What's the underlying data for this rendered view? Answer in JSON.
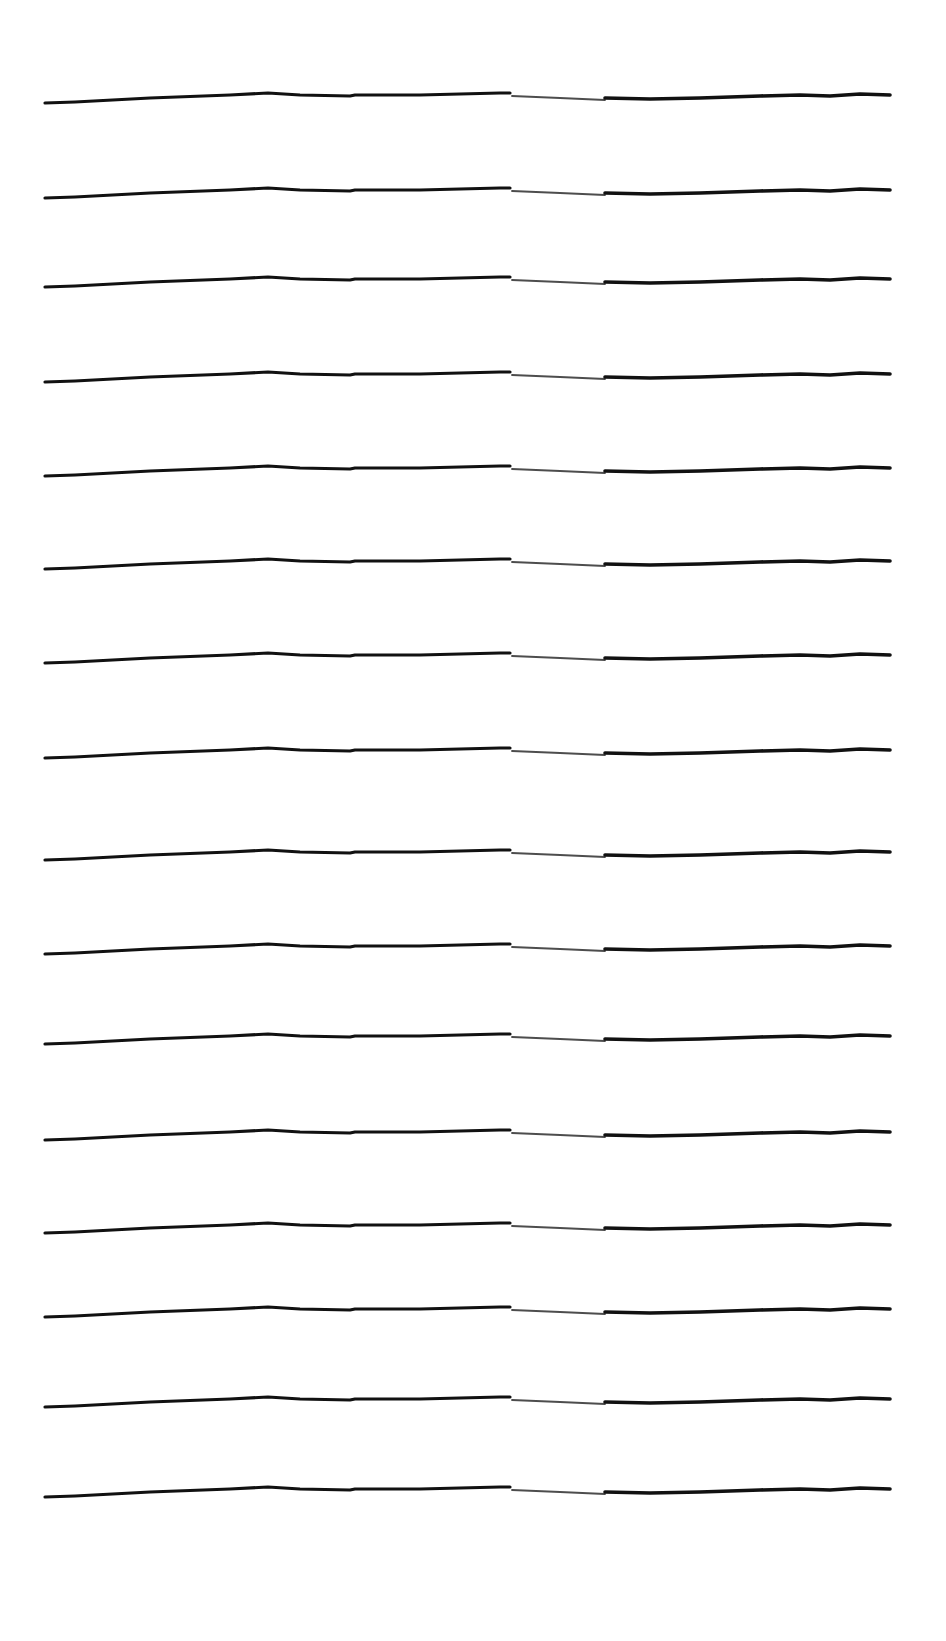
{
  "page": {
    "type": "lined-paper",
    "background_color": "#ffffff",
    "line_color": "#111111",
    "line_count": 16,
    "line_start_x": 45,
    "line_end_x": 890,
    "lines_y": [
      101,
      196,
      285,
      380,
      474,
      567,
      661,
      756,
      858,
      952,
      1042,
      1138,
      1231,
      1315,
      1405,
      1495
    ]
  }
}
